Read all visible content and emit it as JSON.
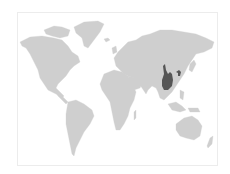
{
  "map": {
    "title": "World map",
    "projection": "equirectangular-like",
    "highlighted_region": "Central/Southwest China",
    "colors": {
      "background": "#ffffff",
      "frame_border": "#ececec",
      "land": "#cfcfcf",
      "highlight": "#555555"
    }
  }
}
